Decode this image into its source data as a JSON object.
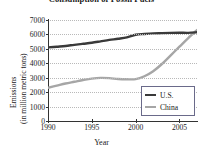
{
  "chart_data": {
    "type": "line",
    "title": "Consumption of Fossil Fuels",
    "xlabel": "Year",
    "ylabel_line1": "Emissions",
    "ylabel_line2": "(in million metric tons)",
    "xlim": [
      1990,
      2007
    ],
    "ylim": [
      0,
      7000
    ],
    "grid": true,
    "legend_position": "bottom-right",
    "ytick_labels": [
      "7000",
      "6000",
      "5000",
      "4000",
      "3000",
      "2000",
      "1000",
      "0"
    ],
    "ytick_values": [
      7000,
      6000,
      5000,
      4000,
      3000,
      2000,
      1000,
      0
    ],
    "xtick_labels": [
      "1990",
      "1995",
      "2000",
      "2005"
    ],
    "xtick_values": [
      1990,
      1995,
      2000,
      2005
    ],
    "x": [
      1990,
      1991,
      1992,
      1993,
      1994,
      1995,
      1996,
      1997,
      1998,
      1999,
      2000,
      2001,
      2002,
      2003,
      2004,
      2005,
      2006,
      2007
    ],
    "series": [
      {
        "name": "U.S.",
        "color": "#3a3a3a",
        "values": [
          5100,
          5150,
          5200,
          5280,
          5350,
          5420,
          5520,
          5620,
          5700,
          5800,
          5980,
          6030,
          6070,
          6090,
          6110,
          6120,
          6110,
          6150
        ]
      },
      {
        "name": "China",
        "color": "#a6a6a6",
        "values": [
          2300,
          2450,
          2600,
          2720,
          2840,
          2940,
          2990,
          2970,
          2910,
          2890,
          2900,
          3100,
          3450,
          3950,
          4550,
          5150,
          5750,
          6300
        ]
      }
    ]
  },
  "legend": {
    "entries": [
      {
        "label": "U.S.",
        "color": "#3a3a3a"
      },
      {
        "label": "China",
        "color": "#a6a6a6"
      }
    ]
  },
  "colors": {
    "us_line": "#3a3a3a",
    "china_line": "#a6a6a6",
    "axis": "#333333",
    "grid": "#b9b9b9",
    "legend_border": "#6a6a8a",
    "text": "#1a1a1a",
    "background": "#ffffff"
  }
}
